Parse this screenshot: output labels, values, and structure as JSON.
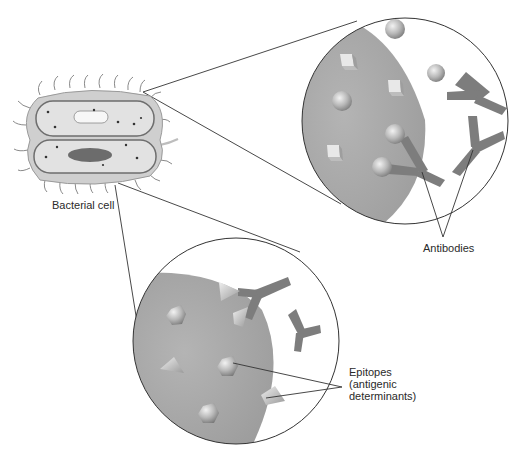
{
  "labels": {
    "bacterial_cell": "Bacterial cell",
    "antibodies": "Antibodies",
    "epitopes_line1": "Epitopes",
    "epitopes_line2": "(antigenic",
    "epitopes_line3": "determinants)"
  },
  "colors": {
    "cell_surface": "#a9a9a9",
    "antibody": "#7a7a7a",
    "epitope": "#c8c8c8",
    "outline": "#333333"
  },
  "top_inset": {
    "epitope_shapes": [
      "sphere",
      "cube"
    ],
    "antibody_count": 3
  },
  "bottom_inset": {
    "epitope_shapes": [
      "pyramid",
      "hexagon-sphere"
    ],
    "antibody_count": 2
  }
}
